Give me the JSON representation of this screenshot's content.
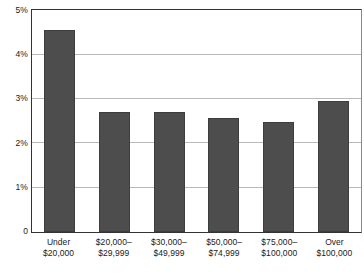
{
  "chart_data": {
    "type": "bar",
    "title": "",
    "subtitle": "",
    "xlabel": "",
    "ylabel": "",
    "categories": [
      "Under $20,000",
      "$20,000–$29,999",
      "$30,000–$49,999",
      "$50,000–$74,999",
      "$75,000–$100,000",
      "Over $100,000"
    ],
    "category_lines": [
      [
        "Under",
        "$20,000"
      ],
      [
        "$20,000–",
        "$29,999"
      ],
      [
        "$30,000–",
        "$49,999"
      ],
      [
        "$50,000–",
        "$74,999"
      ],
      [
        "$75,000–",
        "$100,000"
      ],
      [
        "Over",
        "$100,000"
      ]
    ],
    "values": [
      4.57,
      2.71,
      2.72,
      2.59,
      2.5,
      2.97
    ],
    "value_unit": "%",
    "ylim": [
      0,
      5
    ],
    "ytick_values": [
      5,
      4,
      3,
      2,
      1,
      0
    ],
    "ytick_labels": [
      "5%",
      "4%",
      "3%",
      "2%",
      "1%",
      "0"
    ],
    "gridlines": [
      4,
      3,
      2,
      1
    ],
    "grid": true,
    "legend": false,
    "legend_position": "none",
    "bar_color": "#4d4d4d",
    "grid_color": "#b9b9b9",
    "axis_color": "#333333",
    "background_color": "#ffffff",
    "annotations": []
  }
}
